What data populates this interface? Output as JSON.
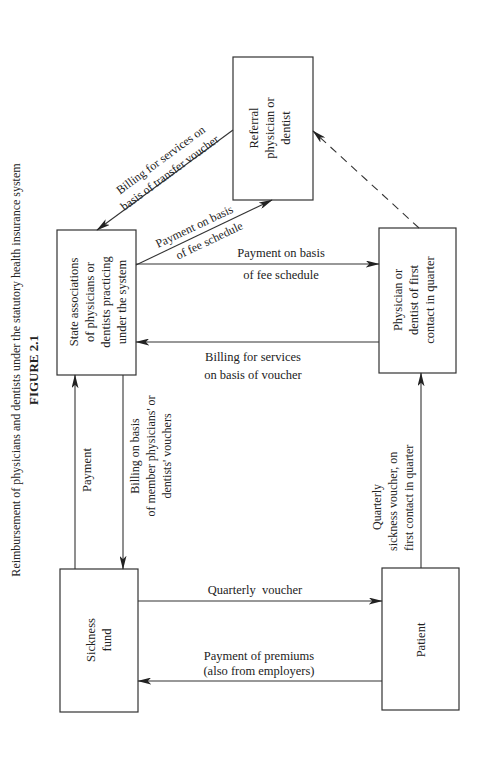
{
  "figure": {
    "number": "FIGURE 2.1",
    "caption": "Reimbursement of physicians and dentists under the statutory health insurance system"
  },
  "nodes": {
    "referral": {
      "lines": [
        "Referral",
        "physician or",
        "dentist"
      ]
    },
    "state_assoc": {
      "lines": [
        "State associations",
        "of physicians or",
        "dentists practicing",
        "under the system"
      ]
    },
    "physician_first": {
      "lines": [
        "Physician or",
        "dentist of first",
        "contact in quarter"
      ]
    },
    "sickness_fund": {
      "lines": [
        "Sickness",
        "fund"
      ]
    },
    "patient": {
      "lines": [
        "Patient"
      ]
    }
  },
  "edges": {
    "billing_transfer": {
      "lines": [
        "Billing for services on",
        "basis of transfer voucher"
      ],
      "from": "referral",
      "to": "state_assoc",
      "style": "solid"
    },
    "payment_fee_referral": {
      "lines": [
        "Payment on basis",
        "of fee schedule"
      ],
      "from": "state_assoc",
      "to": "referral",
      "style": "solid"
    },
    "payment_fee_physician": {
      "lines": [
        "Payment on basis",
        "of fee schedule"
      ],
      "from": "state_assoc",
      "to": "physician_first",
      "style": "solid"
    },
    "billing_voucher": {
      "lines": [
        "Billing for services",
        "on basis of voucher"
      ],
      "from": "physician_first",
      "to": "state_assoc",
      "style": "solid"
    },
    "referral_dashed": {
      "from": "physician_first",
      "to": "referral",
      "style": "dashed"
    },
    "payment_fund": {
      "label": "Payment",
      "from": "sickness_fund",
      "to": "state_assoc",
      "style": "solid"
    },
    "billing_member": {
      "lines": [
        "Billing on basis",
        "of member physicians' or",
        "dentists' vouchers"
      ],
      "from": "state_assoc",
      "to": "sickness_fund",
      "style": "solid"
    },
    "quarterly_sickness": {
      "lines": [
        "Quarterly",
        "sickness voucher, on",
        "first contact in quarter"
      ],
      "from": "patient",
      "to": "physician_first",
      "style": "solid"
    },
    "quarterly_voucher": {
      "label": "Quarterly  voucher",
      "from": "sickness_fund",
      "to": "patient",
      "style": "solid"
    },
    "premiums": {
      "lines": [
        "Payment of premiums",
        "(also from employers)"
      ],
      "from": "patient",
      "to": "sickness_fund",
      "style": "solid"
    }
  }
}
